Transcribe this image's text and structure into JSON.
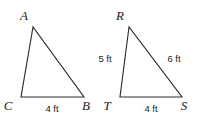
{
  "figure": {
    "background_color": "#ffffff",
    "stroke_color": "#2e2e2e",
    "text_color": "#1c1c1c",
    "shapes": [
      {
        "name": "triangle-abc",
        "vertices": [
          {
            "label": "A",
            "x": 33,
            "y": 27,
            "label_x": 24,
            "label_y": 20
          },
          {
            "label": "C",
            "x": 21,
            "y": 97,
            "label_x": 8,
            "label_y": 110
          },
          {
            "label": "B",
            "x": 84,
            "y": 97,
            "label_x": 86,
            "label_y": 110
          }
        ],
        "side_labels": [
          {
            "text": "4 ft",
            "x": 52,
            "y": 112,
            "anchor": "middle"
          }
        ]
      },
      {
        "name": "triangle-rts",
        "vertices": [
          {
            "label": "R",
            "x": 129,
            "y": 27,
            "label_x": 120,
            "label_y": 20
          },
          {
            "label": "T",
            "x": 120,
            "y": 97,
            "label_x": 107,
            "label_y": 110
          },
          {
            "label": "S",
            "x": 182,
            "y": 97,
            "label_x": 184,
            "label_y": 110
          }
        ],
        "side_labels": [
          {
            "text": "5 ft",
            "x": 105,
            "y": 62,
            "anchor": "middle"
          },
          {
            "text": "6 ft",
            "x": 174,
            "y": 62,
            "anchor": "middle"
          },
          {
            "text": "4 ft",
            "x": 151,
            "y": 112,
            "anchor": "middle"
          }
        ]
      }
    ]
  }
}
